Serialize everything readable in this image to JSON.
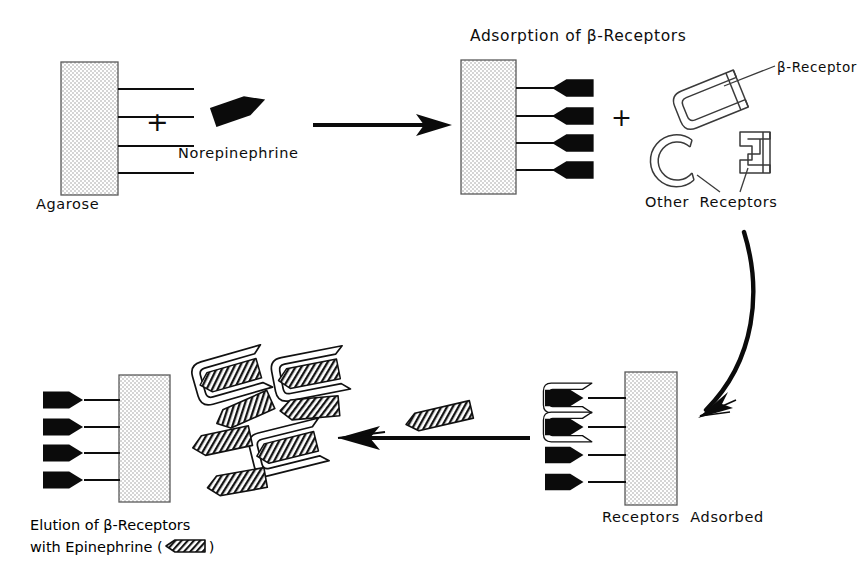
{
  "figure": {
    "kind": "scientific-flow-diagram",
    "background_color": "#ffffff",
    "ink_color": "#111111",
    "gel_fill_color": "#ebebeb",
    "gel_border_color": "#555555"
  },
  "labels": {
    "agarose": "Agarose",
    "plus_sign_1": "+",
    "norepinephrine": "Norepinephrine",
    "adsorption_title": "Adsorption of β-Receptors",
    "plus_sign_2": "+",
    "beta_receptor": "β-Receptor",
    "other_receptors": "Other  Receptors",
    "receptors_adsorbed": "Receptors  Adsorbed",
    "elution_line1": "Elution of β-Receptors",
    "elution_line2_prefix": "with Epinephrine (",
    "elution_line2_suffix": ")"
  },
  "steps": [
    {
      "id": "step-1",
      "name": "agarose-plus-norepinephrine",
      "label": "Agarose",
      "description": "Agarose gel block with four linker arms, plus free norepinephrine ligand"
    },
    {
      "id": "step-2",
      "name": "adsorption-of-beta-receptors",
      "label": "Adsorption of β-Receptors",
      "description": "Norepinephrine coupled to agarose arms, mixed with beta-receptors and other receptors"
    },
    {
      "id": "step-3",
      "name": "receptors-adsorbed",
      "label": "Receptors  Adsorbed",
      "description": "Beta-receptors bound to the top two immobilized norepinephrine ligands"
    },
    {
      "id": "step-4",
      "name": "elution-of-beta-receptors",
      "label": "Elution of β-Receptors with Epinephrine",
      "description": "Epinephrine displaces the beta-receptors, releasing them from the column"
    }
  ],
  "legend": [
    {
      "symbol": "black-wedge",
      "meaning": "Norepinephrine"
    },
    {
      "symbol": "hatched-wedge",
      "meaning": "Epinephrine"
    },
    {
      "symbol": "open-bracket",
      "meaning": "β-Receptor"
    },
    {
      "symbol": "c-arc-and-square-bracket",
      "meaning": "Other  Receptors"
    }
  ],
  "gel_blocks": [
    {
      "name": "agarose-block-top-left",
      "x": 61,
      "y": 62,
      "w": 57,
      "h": 133,
      "arm_side": "right",
      "arms": 4
    },
    {
      "name": "agarose-block-top-right",
      "x": 461,
      "y": 60,
      "w": 55,
      "h": 134,
      "arm_side": "right",
      "arms": 4
    },
    {
      "name": "agarose-block-bottom-right",
      "x": 625,
      "y": 372,
      "w": 52,
      "h": 133,
      "arm_side": "left",
      "arms": 4
    },
    {
      "name": "agarose-block-bottom-left",
      "x": 119,
      "y": 375,
      "w": 51,
      "h": 127,
      "arm_side": "left",
      "arms": 4
    }
  ],
  "arrows": [
    {
      "name": "arrow-step1-to-step2",
      "direction": "right",
      "x1": 313,
      "y1": 125,
      "x2": 452,
      "y2": 125
    },
    {
      "name": "arrow-curved-step2-to-step3",
      "direction": "down-left-curve",
      "from": [
        727,
        228
      ],
      "to": [
        700,
        414
      ]
    },
    {
      "name": "arrow-step3-to-step4",
      "direction": "left",
      "x1": 530,
      "y1": 438,
      "x2": 338,
      "y2": 438
    }
  ],
  "label_positions": {
    "agarose": {
      "x": 36,
      "y": 198
    },
    "plus_1": {
      "x": 152,
      "y": 113
    },
    "norepinephrine": {
      "x": 180,
      "y": 145
    },
    "adsorption_title": {
      "x": 468,
      "y": 26
    },
    "plus_2": {
      "x": 612,
      "y": 110
    },
    "beta_receptor": {
      "x": 768,
      "y": 60
    },
    "other_receptors": {
      "x": 645,
      "y": 193
    },
    "receptors_adsorbed": {
      "x": 602,
      "y": 508
    },
    "elution_caption": {
      "x": 30,
      "y": 516
    }
  }
}
